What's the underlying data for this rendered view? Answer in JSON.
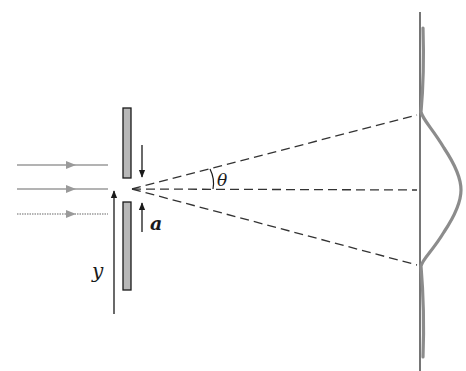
{
  "diagram": {
    "labels": {
      "angle": "θ",
      "slit_width": "a",
      "position": "y"
    },
    "colors": {
      "background": "#ffffff",
      "ink": "#1a1a1a",
      "incident_rays": "#9a9a9a",
      "slit_fill": "#b8b8b8",
      "intensity_curve": "#8c8c8c",
      "dashed_lines": "#333333"
    },
    "elements": {
      "incident_rays_count": 3,
      "slit_plates_count": 2,
      "dashed_rays_count": 3
    }
  }
}
